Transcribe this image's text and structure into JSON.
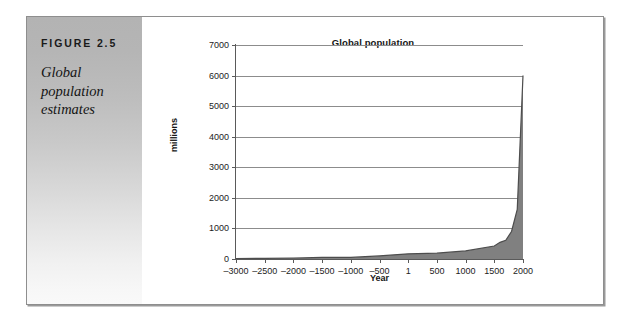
{
  "figure": {
    "label": "FIGURE 2.5",
    "caption": "Global population estimates"
  },
  "colors": {
    "series_fill": "#808080",
    "series_line": "#4d4d4d",
    "gridline": "#8c8c8c",
    "axis": "#5a5a5a",
    "panel_top": "#b3b3b3",
    "panel_bottom": "#f9f9f9",
    "text": "#1a1a1a"
  },
  "chart_data": {
    "type": "area",
    "title": "Global population",
    "xlabel": "Year",
    "ylabel": "millions",
    "xlim": [
      -3000,
      2000
    ],
    "ylim": [
      0,
      7000
    ],
    "grid": true,
    "legend": "none",
    "xticks": [
      -3000,
      -2500,
      -2000,
      -1500,
      -1000,
      -500,
      1,
      500,
      1000,
      1500,
      2000
    ],
    "xticklabels": [
      "–3000",
      "–2500",
      "–2000",
      "–1500",
      "–1000",
      "–500",
      "1",
      "500",
      "1000",
      "1500",
      "2000"
    ],
    "yticks": [
      0,
      1000,
      2000,
      3000,
      4000,
      5000,
      6000,
      7000
    ],
    "yticklabels": [
      "0",
      "1000",
      "2000",
      "3000",
      "4000",
      "5000",
      "6000",
      "7000"
    ],
    "series": [
      {
        "name": "Global population",
        "x": [
          -3000,
          -2500,
          -2000,
          -1500,
          -1000,
          -500,
          1,
          500,
          1000,
          1500,
          1600,
          1700,
          1800,
          1900,
          2000
        ],
        "values": [
          14,
          20,
          27,
          50,
          50,
          100,
          170,
          190,
          265,
          425,
          545,
          610,
          900,
          1625,
          6000
        ]
      }
    ]
  }
}
